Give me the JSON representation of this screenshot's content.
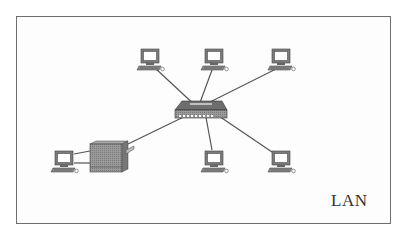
{
  "diagram": {
    "label": "LAN",
    "type": "star-topology",
    "hub": {
      "name": "switch",
      "icon": "switch-icon",
      "x": 198,
      "y": 110
    },
    "nodes": [
      {
        "name": "pc-top-1",
        "icon": "computer-icon",
        "x": 152,
        "y": 60
      },
      {
        "name": "pc-top-2",
        "icon": "computer-icon",
        "x": 216,
        "y": 60
      },
      {
        "name": "pc-top-3",
        "icon": "computer-icon",
        "x": 282,
        "y": 60
      },
      {
        "name": "printer",
        "icon": "printer-icon",
        "x": 108,
        "y": 157
      },
      {
        "name": "pc-bottom-1",
        "icon": "computer-icon",
        "x": 216,
        "y": 162
      },
      {
        "name": "pc-bottom-2",
        "icon": "computer-icon",
        "x": 282,
        "y": 162
      },
      {
        "name": "pc-left",
        "icon": "computer-icon",
        "x": 64,
        "y": 162
      }
    ],
    "colors": {
      "line": "#555555",
      "border": "#6e6e6e",
      "device": "#8a8a8a"
    }
  }
}
